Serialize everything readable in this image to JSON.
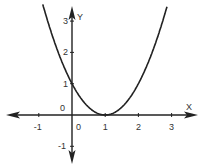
{
  "chart_data": {
    "type": "line",
    "title": "",
    "xlabel": "X",
    "ylabel": "Y",
    "function": "y = (x - 1)^2",
    "x_ticks": [
      "-1",
      "0",
      "1",
      "2",
      "3"
    ],
    "y_ticks": [
      "-1",
      "0",
      "1",
      "2",
      "3"
    ],
    "xlim": [
      -1.9,
      3.5
    ],
    "ylim": [
      -1.5,
      3.5
    ],
    "grid": false,
    "legend": null,
    "series": [
      {
        "name": "parabola",
        "x": [
          -0.85,
          -0.5,
          0,
          0.5,
          1,
          1.5,
          2,
          2.5,
          2.85
        ],
        "y": [
          3.42,
          2.25,
          1,
          0.25,
          0,
          0.25,
          1,
          2.25,
          3.42
        ]
      }
    ],
    "annotations": [
      "vertex at (1, 0)",
      "y-intercept at (0, 1)"
    ],
    "colors": {
      "axis": "#222222",
      "curve": "#222222"
    }
  }
}
